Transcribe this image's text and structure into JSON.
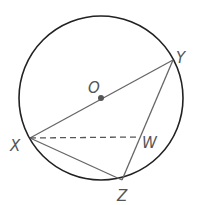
{
  "diagram": {
    "circle": {
      "cx": 101,
      "cy": 98,
      "r": 82,
      "stroke": "#222222"
    },
    "points": {
      "O": {
        "x": 101,
        "y": 98,
        "label": "O",
        "lx": 88,
        "ly": 93
      },
      "X": {
        "x": 30,
        "y": 138,
        "label": "X",
        "lx": 10,
        "ly": 151
      },
      "Y": {
        "x": 173,
        "y": 60,
        "label": "Y",
        "lx": 176,
        "ly": 63
      },
      "Z": {
        "x": 122,
        "y": 180,
        "label": "Z",
        "lx": 117,
        "ly": 201
      },
      "W": {
        "x": 139,
        "y": 137,
        "label": "W",
        "lx": 142,
        "ly": 148
      }
    },
    "segments": [
      {
        "from": "X",
        "to": "Y",
        "style": "solid"
      },
      {
        "from": "Y",
        "to": "Z",
        "style": "solid"
      },
      {
        "from": "X",
        "to": "Z",
        "style": "solid"
      },
      {
        "from": "X",
        "to": "W",
        "style": "dashed"
      }
    ],
    "colors": {
      "line": "#666666",
      "circle": "#222222",
      "dot": "#555555",
      "label": "#555555"
    }
  }
}
